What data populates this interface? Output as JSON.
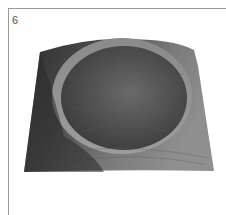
{
  "figure": {
    "number": "6",
    "image_subject": "square wooden bowl with circular hollow",
    "colors": {
      "wood_dark": "#3a3a3a",
      "wood_mid": "#6e6e6e",
      "wood_light": "#9b9b9b",
      "frame": "#9a9a9a"
    }
  }
}
